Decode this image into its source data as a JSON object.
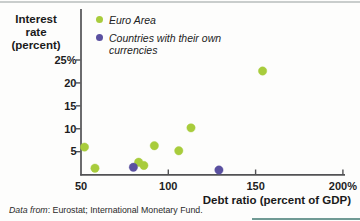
{
  "figure": {
    "ylabel_line1": "Interest rate",
    "ylabel_line2": "(percent)",
    "source_prefix": "Data from",
    "source_rest": ": Eurostat; International Monetary Fund."
  },
  "colors": {
    "euro_area": "#a8cc3c",
    "own_currencies": "#5a50a0",
    "axis": "#525254",
    "text": "#1d1d1f",
    "top_border": "#c9cdcc"
  },
  "chart_data": {
    "type": "scatter",
    "title": "",
    "xlabel": "Debt ratio (percent of GDP)",
    "ylabel": "Interest rate (percent)",
    "xlim": [
      50,
      210
    ],
    "ylim": [
      0,
      36
    ],
    "grid": false,
    "legend_position": "top-left-inside",
    "x_ticks": [
      {
        "value": 50,
        "label": "50"
      },
      {
        "value": 100,
        "label": "100"
      },
      {
        "value": 150,
        "label": "150"
      },
      {
        "value": 200,
        "label": "200%"
      }
    ],
    "y_ticks": [
      {
        "value": 5,
        "label": "5"
      },
      {
        "value": 10,
        "label": "10"
      },
      {
        "value": 15,
        "label": "15"
      },
      {
        "value": 20,
        "label": "20"
      },
      {
        "value": 25,
        "label": "25%"
      }
    ],
    "series": [
      {
        "name": "Euro Area",
        "color": "#a8cc3c",
        "points": [
          {
            "x": 52,
            "y": 6.0
          },
          {
            "x": 58,
            "y": 1.4
          },
          {
            "x": 83,
            "y": 2.7
          },
          {
            "x": 86,
            "y": 2.0
          },
          {
            "x": 92,
            "y": 6.3
          },
          {
            "x": 106,
            "y": 5.2
          },
          {
            "x": 113,
            "y": 10.2
          },
          {
            "x": 154,
            "y": 22.6
          }
        ]
      },
      {
        "name": "Countries with their own currencies",
        "color": "#5a50a0",
        "points": [
          {
            "x": 80,
            "y": 1.6
          },
          {
            "x": 129,
            "y": 1.0
          }
        ]
      }
    ]
  }
}
